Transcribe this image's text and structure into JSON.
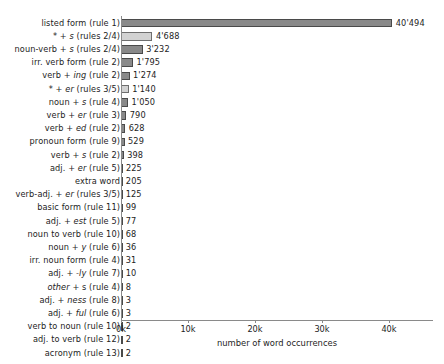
{
  "chart_data": {
    "type": "bar",
    "orientation": "horizontal",
    "title": "",
    "xlabel": "number of word occurrences",
    "ylabel": "",
    "xlim": [
      0,
      44500
    ],
    "grid": false,
    "legend": null,
    "xticks": [
      {
        "value": 0,
        "label": "0k"
      },
      {
        "value": 10000,
        "label": "10k"
      },
      {
        "value": 20000,
        "label": "20k"
      },
      {
        "value": 30000,
        "label": "30k"
      },
      {
        "value": 40000,
        "label": "40k"
      }
    ],
    "categories": [
      "listed form (rule 1)",
      "* + s (rules 2/4)",
      "noun-verb + s (rules 2/4)",
      "irr. verb form (rule 2)",
      "verb + ing (rule 2)",
      "* + er (rules 3/5)",
      "noun + s (rule 4)",
      "verb + er (rule 3)",
      "verb + ed (rule 2)",
      "pronoun form (rule 9)",
      "verb + s (rule 2)",
      "adj. + er (rule 5)",
      "extra word",
      "verb-adj. + er (rules 3/5)",
      "basic form (rule 11)",
      "adj. + est (rule 5)",
      "noun to verb (rule 10)",
      "noun + y (rule 6)",
      "irr. noun form (rule 4)",
      "adj. + -ly (rule 7)",
      "other + s (rule 4)",
      "adj. + ness (rule 8)",
      "adj. + ful (rule 6)",
      "verb to noun (rule 10)",
      "adj. to verb (rule 12)",
      "acronym (rule 13)"
    ],
    "values": [
      40494,
      4688,
      3232,
      1795,
      1274,
      1140,
      1050,
      790,
      628,
      529,
      398,
      225,
      205,
      125,
      99,
      77,
      68,
      36,
      31,
      10,
      8,
      3,
      3,
      2,
      2,
      2
    ],
    "value_labels": [
      "40'494",
      "4'688",
      "3'232",
      "1'795",
      "1'274",
      "1'140",
      "1'050",
      "790",
      "628",
      "529",
      "398",
      "225",
      "205",
      "125",
      "99",
      "77",
      "68",
      "36",
      "31",
      "10",
      "8",
      "3",
      "3",
      "2",
      "2",
      "2"
    ],
    "colors": {
      "bar_dark": "#898989",
      "bar_light": "#d2d2d2",
      "bar_edge": "#4a4a4a",
      "axis": "#8a8a8a",
      "text": "#1d1d1d",
      "background": "#ffffff"
    },
    "highlighted_indices": [
      1,
      5
    ]
  },
  "rows": [
    {
      "label_html": "listed form (rule 1)",
      "value": 40494,
      "value_label": "40'494",
      "light": false
    },
    {
      "label_html": "<span class=\"ital\">*</span> + <span class=\"ital\">s</span> (rules 2/4)",
      "value": 4688,
      "value_label": "4'688",
      "light": true
    },
    {
      "label_html": "noun-verb + <span class=\"ital\">s</span> (rules 2/4)",
      "value": 3232,
      "value_label": "3'232",
      "light": false
    },
    {
      "label_html": "irr. verb form (rule 2)",
      "value": 1795,
      "value_label": "1'795",
      "light": false
    },
    {
      "label_html": "verb + <span class=\"ital\">ing</span> (rule 2)",
      "value": 1274,
      "value_label": "1'274",
      "light": false
    },
    {
      "label_html": "<span class=\"ital\">*</span> + <span class=\"ital\">er</span> (rules 3/5)",
      "value": 1140,
      "value_label": "1'140",
      "light": true
    },
    {
      "label_html": "noun + <span class=\"ital\">s</span> (rule 4)",
      "value": 1050,
      "value_label": "1'050",
      "light": false
    },
    {
      "label_html": "verb + <span class=\"ital\">er</span> (rule 3)",
      "value": 790,
      "value_label": "790",
      "light": false
    },
    {
      "label_html": "verb + <span class=\"ital\">ed</span> (rule 2)",
      "value": 628,
      "value_label": "628",
      "light": false
    },
    {
      "label_html": "pronoun form (rule 9)",
      "value": 529,
      "value_label": "529",
      "light": false
    },
    {
      "label_html": "verb + <span class=\"ital\">s</span> (rule 2)",
      "value": 398,
      "value_label": "398",
      "light": false
    },
    {
      "label_html": "adj. + <span class=\"ital\">er</span> (rule 5)",
      "value": 225,
      "value_label": "225",
      "light": false
    },
    {
      "label_html": "extra word",
      "value": 205,
      "value_label": "205",
      "light": false
    },
    {
      "label_html": "verb-adj. + <span class=\"ital\">er</span> (rules 3/5)",
      "value": 125,
      "value_label": "125",
      "light": false
    },
    {
      "label_html": "basic form (rule 11)",
      "value": 99,
      "value_label": "99",
      "light": false
    },
    {
      "label_html": "adj. + <span class=\"ital\">est</span> (rule 5)",
      "value": 77,
      "value_label": "77",
      "light": false
    },
    {
      "label_html": "noun to verb (rule 10)",
      "value": 68,
      "value_label": "68",
      "light": false
    },
    {
      "label_html": "noun + <span class=\"ital\">y</span> (rule 6)",
      "value": 36,
      "value_label": "36",
      "light": false
    },
    {
      "label_html": "irr. noun form (rule 4)",
      "value": 31,
      "value_label": "31",
      "light": false
    },
    {
      "label_html": "adj. + <span class=\"ital\">-ly</span> (rule 7)",
      "value": 10,
      "value_label": "10",
      "light": false
    },
    {
      "label_html": "<span class=\"ital\">other</span> + s (rule 4)",
      "value": 8,
      "value_label": "8",
      "light": false
    },
    {
      "label_html": "adj. + <span class=\"ital\">ness</span> (rule 8)",
      "value": 3,
      "value_label": "3",
      "light": false
    },
    {
      "label_html": "adj. + <span class=\"ital\">ful</span> (rule 6)",
      "value": 3,
      "value_label": "3",
      "light": false
    },
    {
      "label_html": "verb to noun (rule 10)",
      "value": 2,
      "value_label": "2",
      "light": false
    },
    {
      "label_html": "adj. to verb (rule 12)",
      "value": 2,
      "value_label": "2",
      "light": false
    },
    {
      "label_html": "acronym (rule 13)",
      "value": 2,
      "value_label": "2",
      "light": false
    }
  ],
  "axis": {
    "xlabel": "number of word occurrences",
    "ticks": [
      "0k",
      "10k",
      "20k",
      "30k",
      "40k"
    ]
  }
}
